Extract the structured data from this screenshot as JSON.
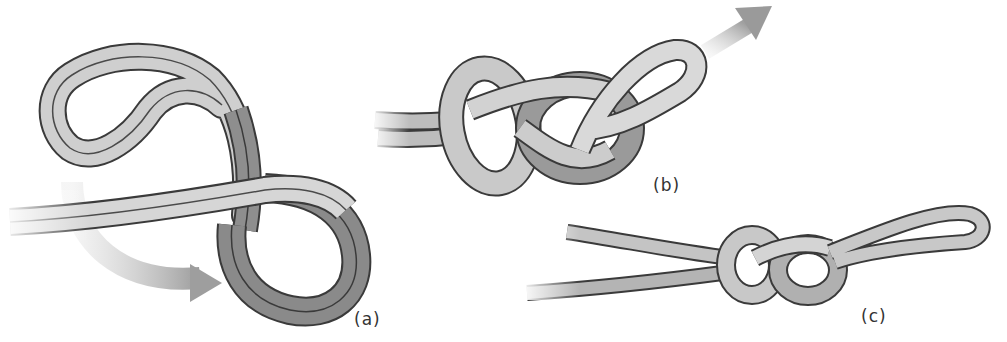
{
  "figure": {
    "panels": [
      {
        "id": "a",
        "label": "(a)",
        "description": "Rope doubled into a bight and twisted into a figure-eight shape; arrow shows working end wrapping around"
      },
      {
        "id": "b",
        "label": "(b)",
        "description": "Loop passed back through to form the figure-eight; arrow indicates pulling direction up and right"
      },
      {
        "id": "c",
        "label": "(c)",
        "description": "Finished, tightened figure-eight loop knot"
      }
    ],
    "colors": {
      "rope_fill": "#d9d9d9",
      "rope_shadow": "#8a8a8a",
      "rope_outline": "#3a3a3a",
      "arrow": "#a8a8a8",
      "label_text": "#333333"
    }
  }
}
